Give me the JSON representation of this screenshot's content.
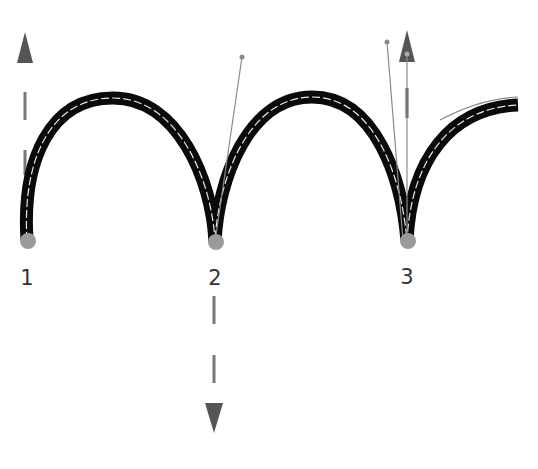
{
  "diagram": {
    "type": "bezier-path-anchor-illustration",
    "colors": {
      "stroke": "#0a0a0a",
      "inner_stroke": "#e8e8e8",
      "anchor_fill": "#9a9a9a",
      "arrow_fill": "#555555",
      "handle_line": "#8a8a8a",
      "label": "#333333"
    },
    "anchors": [
      {
        "id": 1,
        "label": "1",
        "x": 27,
        "y": 241,
        "direction": "up"
      },
      {
        "id": 2,
        "label": "2",
        "x": 215,
        "y": 242,
        "direction": "down"
      },
      {
        "id": 3,
        "label": "3",
        "x": 407,
        "y": 241,
        "direction": "up"
      }
    ],
    "handles": [
      {
        "anchor": 2,
        "x": 242,
        "y": 57
      },
      {
        "anchor": 3,
        "x": 387,
        "y": 42
      },
      {
        "anchor": 3,
        "x": 407,
        "y": 54
      }
    ],
    "arrows": [
      {
        "anchor": 1,
        "direction": "up",
        "x": 25
      },
      {
        "anchor": 2,
        "direction": "down",
        "x": 214
      },
      {
        "anchor": 3,
        "direction": "up",
        "x": 407
      }
    ]
  }
}
